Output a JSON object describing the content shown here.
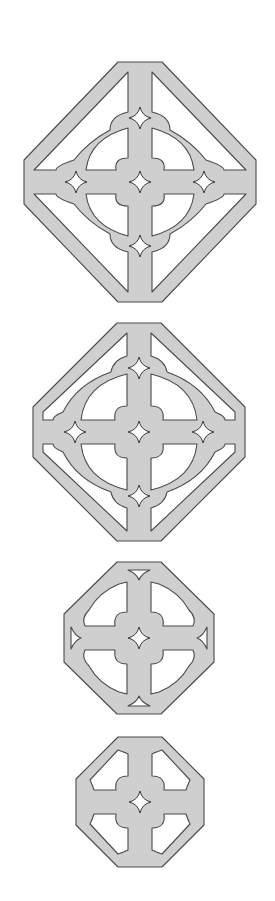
{
  "figure": {
    "fill_color": "#cfcfcf",
    "outline_color": "#4a4a4a",
    "background": "#ffffff"
  },
  "tiles": [
    {
      "id": "tile-1",
      "label": "",
      "center": [
        140,
        182
      ],
      "ring": true,
      "outer_frame": "large diamond-octagon with diagonal struts",
      "star_holes": 5
    },
    {
      "id": "tile-2",
      "label": "",
      "center": [
        139,
        432
      ],
      "ring": true,
      "outer_frame": "octagon touching ring",
      "star_holes": 5
    },
    {
      "id": "tile-3",
      "label": "",
      "center": [
        139,
        638
      ],
      "ring": false,
      "outer_frame": "octagon with triangular notches",
      "star_holes": 1
    },
    {
      "id": "tile-4",
      "label": "",
      "center": [
        140,
        802
      ],
      "ring": false,
      "outer_frame": "plain octagon",
      "star_holes": 1
    }
  ]
}
